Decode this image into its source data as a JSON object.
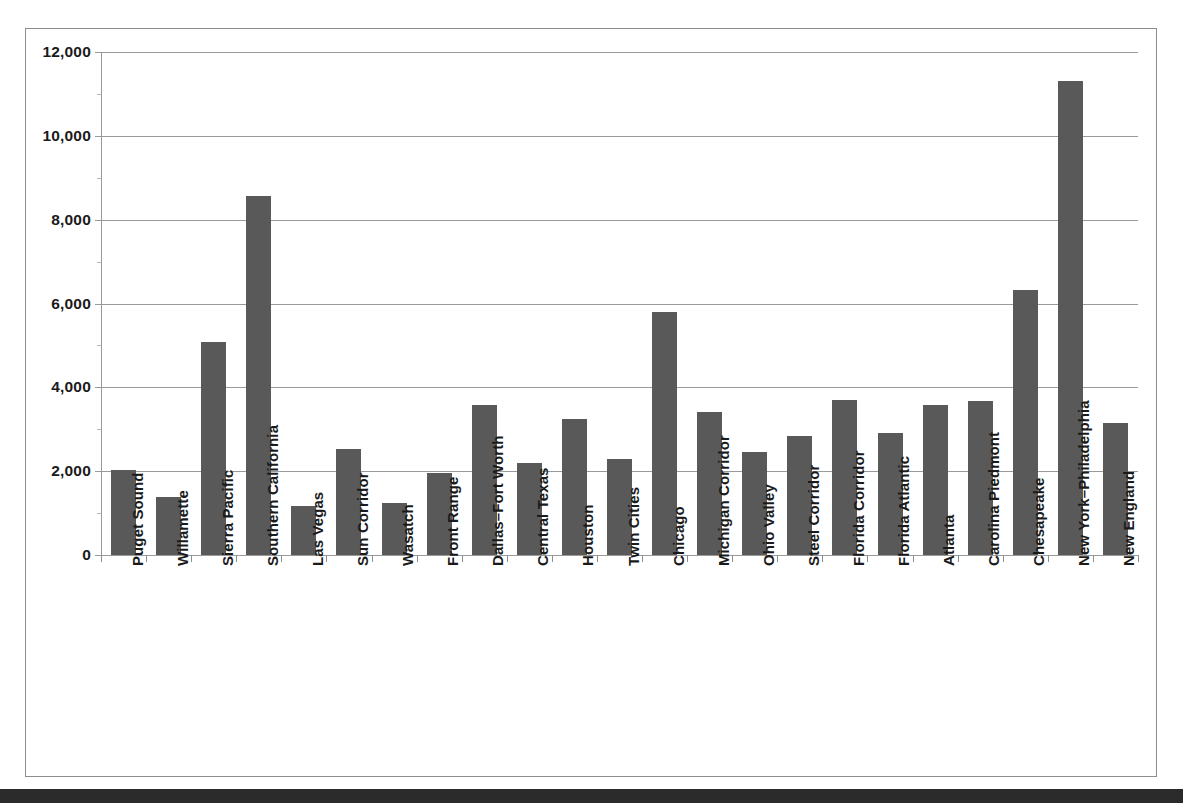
{
  "chart_data": {
    "type": "bar",
    "title": "",
    "subtitle": "",
    "xlabel": "",
    "ylabel": "",
    "ylim": [
      0,
      12000
    ],
    "ytick_values": [
      0,
      2000,
      4000,
      6000,
      8000,
      10000,
      12000
    ],
    "ytick_labels": [
      "0",
      "2,000",
      "4,000",
      "6,000",
      "8,000",
      "10,000",
      "12,000"
    ],
    "grid": true,
    "legend": null,
    "bar_color": "#595959",
    "gridline_color": "#9a9a9a",
    "axis_color": "#9a9a9a",
    "text_color": "#1a1a1a",
    "categories": [
      "Puget Sound",
      "Willamette",
      "Sierra Pacific",
      "Southern California",
      "Las Vegas",
      "Sun Corridor",
      "Wasatch",
      "Front Range",
      "Dallas–Fort Worth",
      "Central Texas",
      "Houston",
      "Twin Cities",
      "Chicago",
      "Michigan Corridor",
      "Ohio Valley",
      "Steel Corridor",
      "Florida Corridor",
      "Florida Atlantic",
      "Atlanta",
      "Carolina Piedmont",
      "Chesapeake",
      "New York–Philadelphia",
      "New England"
    ],
    "values": [
      2020,
      1380,
      5080,
      8570,
      1170,
      2540,
      1230,
      1950,
      3580,
      2200,
      3250,
      2280,
      5800,
      3400,
      2450,
      2830,
      3700,
      2920,
      3580,
      3670,
      6330,
      11310,
      3140
    ]
  }
}
